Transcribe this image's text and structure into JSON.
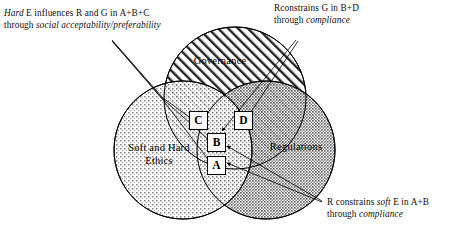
{
  "circles": {
    "governance": {
      "label": "Governance",
      "fill_pattern": "diagonal-hatch",
      "stroke": "#000000"
    },
    "ethics": {
      "label_line1": "Soft and Hard",
      "label_line2": "Ethics",
      "fill_pattern": "sparse-dots",
      "stroke": "#000000"
    },
    "regulations": {
      "label": "Regulations",
      "fill_pattern": "dense-dots",
      "stroke": "#000000"
    }
  },
  "regions": {
    "a": "A",
    "b": "B",
    "c": "C",
    "d": "D"
  },
  "annotations": {
    "ethics_influence": {
      "line1_pre": "Hard",
      "line1_post": " E influences R and G in A+B+C",
      "line2_pre": "through ",
      "line2_em": "social acceptability/preferability",
      "line2_post": ""
    },
    "governance_constraint": {
      "line1_pre": "Rconstrains G in B+D",
      "line2_pre": "through ",
      "line2_em": "compliance",
      "line2_post": ""
    },
    "ethics_constraint": {
      "line1_pre": "R constrains ",
      "line1_em": "soft",
      "line1_post": " E in A+B",
      "line2_pre": "through ",
      "line2_em": "compliance",
      "line2_post": ""
    }
  },
  "colors": {
    "stroke": "#000000",
    "text": "#101010",
    "background": "#ffffff",
    "regulations_tint": "#b8b8b8",
    "ethics_tint": "#d8d8d8"
  }
}
